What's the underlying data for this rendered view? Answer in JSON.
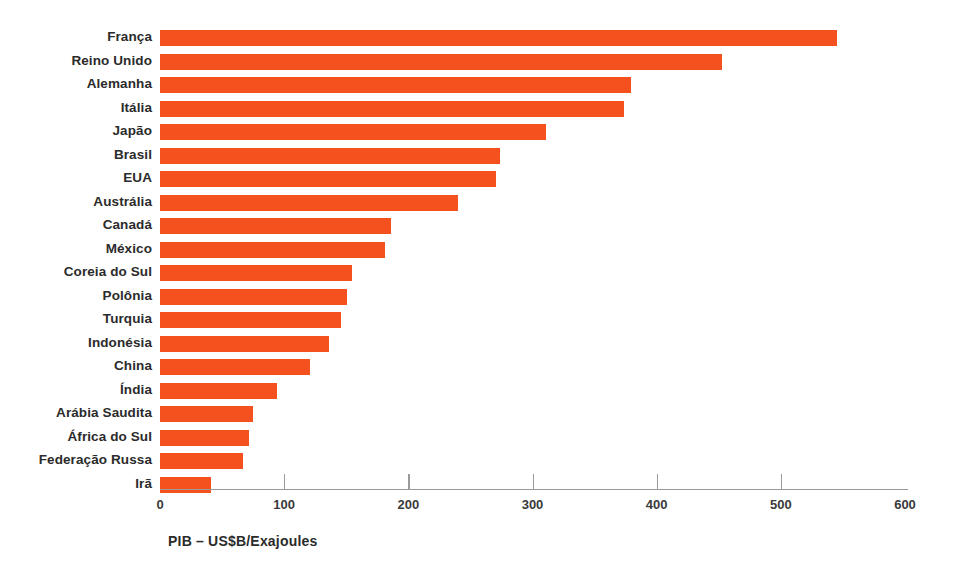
{
  "chart_data": {
    "type": "bar",
    "orientation": "horizontal",
    "title": "",
    "subtitle": "",
    "xlabel": "PIB – US$B/Exajoules",
    "ylabel": "",
    "xlim": [
      0,
      600
    ],
    "ylim": null,
    "xticks": [
      0,
      100,
      200,
      300,
      400,
      500,
      600
    ],
    "xtick_labels": [
      "0",
      "100",
      "200",
      "300",
      "400",
      "500",
      "600"
    ],
    "grid": false,
    "legend": null,
    "bar_color": "#f4511e",
    "categories": [
      "França",
      "Reino Unido",
      "Alemanha",
      "Itália",
      "Japão",
      "Brasil",
      "EUA",
      "Austrália",
      "Canadá",
      "México",
      "Coreia do Sul",
      "Polônia",
      "Turquia",
      "Indonésia",
      "China",
      "Índia",
      "Arábia Saudita",
      "África do Sul",
      "Federação Russa",
      "Irã"
    ],
    "values": [
      545,
      453,
      379,
      374,
      311,
      274,
      271,
      240,
      186,
      181,
      155,
      151,
      146,
      136,
      121,
      94,
      75,
      72,
      67,
      41
    ]
  },
  "axis": {
    "x_title": "PIB – US$B/Exajoules"
  }
}
